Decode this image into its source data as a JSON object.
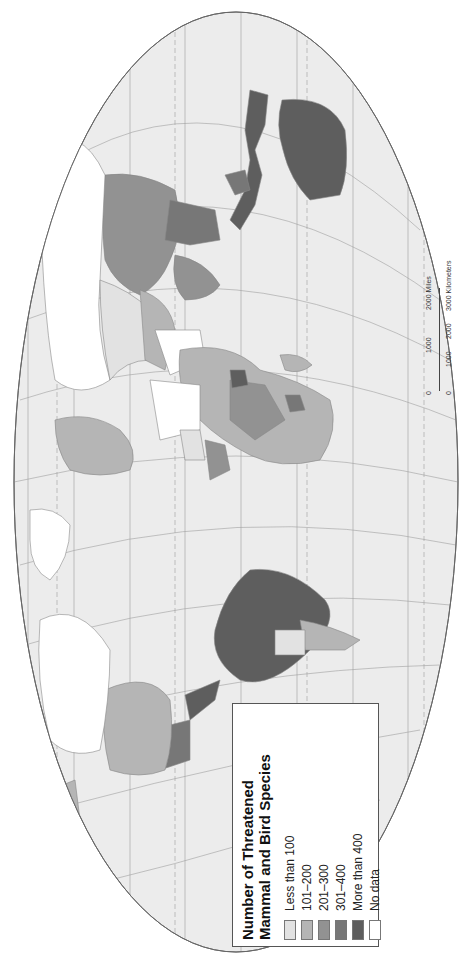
{
  "map": {
    "title": "Number of Threatened Mammal and Bird Species",
    "orientation": "rotated 90 degrees counter-clockwise",
    "projection": "Robinson-like oval world projection",
    "colors": {
      "ocean": "#ececec",
      "graticule": "#9a9a9a",
      "coast": "#8a8a8a",
      "less_than_100": "#e2e2e2",
      "101_200": "#b5b5b5",
      "201_300": "#929292",
      "301_400": "#777777",
      "more_than_400": "#5e5e5e",
      "no_data": "#ffffff"
    }
  },
  "legend": {
    "title_line1": "Number of Threatened",
    "title_line2": "Mammal and Bird Species",
    "items": [
      {
        "label": "Less than 100",
        "color": "#e2e2e2"
      },
      {
        "label": "101–200",
        "color": "#b5b5b5"
      },
      {
        "label": "201–300",
        "color": "#929292"
      },
      {
        "label": "301–400",
        "color": "#777777"
      },
      {
        "label": "More than 400",
        "color": "#5e5e5e"
      },
      {
        "label": "No data",
        "color": "#ffffff"
      }
    ]
  },
  "scale_bar": {
    "miles_ticks": [
      "0",
      "1000",
      "2000 Miles"
    ],
    "km_ticks": [
      "0",
      "1000",
      "2000",
      "3000 Kilometers"
    ]
  }
}
